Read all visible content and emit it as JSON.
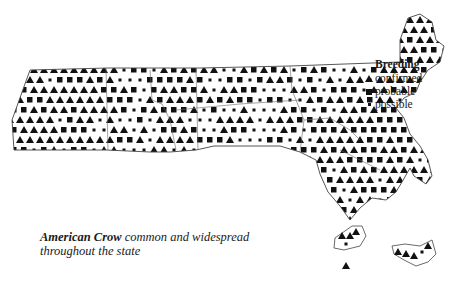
{
  "figure": {
    "species": "American Crow",
    "caption_rest_line1": "common and widespread",
    "caption_line2": "throughout the state"
  },
  "legend": {
    "title": "Breeding",
    "items": [
      {
        "label": "confirmed",
        "symbol": "triangle-icon"
      },
      {
        "label": "probable",
        "symbol": "square-icon"
      },
      {
        "label": "possible",
        "symbol": "dot-icon"
      }
    ]
  },
  "colors": {
    "ink": "#111111",
    "background": "#ffffff",
    "boundary": "#555555"
  },
  "map": {
    "region": "Massachusetts breeding bird atlas blocks",
    "grid_spacing_px": 10
  }
}
